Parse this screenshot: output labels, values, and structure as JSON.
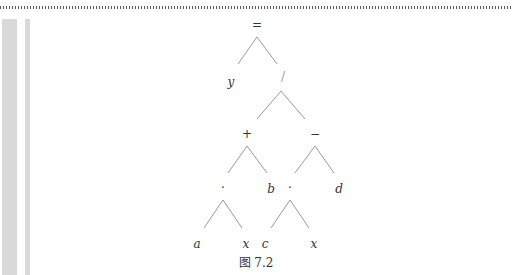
{
  "figure": {
    "caption": "图 7.2",
    "nodes": {
      "root": "=",
      "left_y": "y",
      "div": "/",
      "plus": "+",
      "minus": "−",
      "mul1": "·",
      "b": "b",
      "mul2": "·",
      "d": "d",
      "a": "a",
      "x1": "x",
      "c": "c",
      "x2": "x"
    }
  }
}
